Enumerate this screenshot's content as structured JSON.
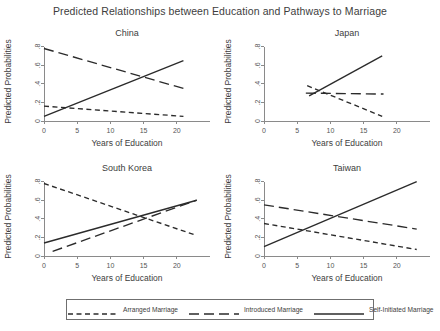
{
  "chart_data": {
    "type": "line",
    "title": "Predicted Relationships between Education and Pathways to Marriage",
    "xlabel": "Years of Education",
    "ylabel": "Predicted Probabilities",
    "xlim": [
      0,
      25
    ],
    "ylim": [
      0,
      0.85
    ],
    "xticks": [
      0,
      5,
      10,
      15,
      20
    ],
    "xtick_labels": [
      "0",
      "5",
      "10",
      "15",
      "20"
    ],
    "yticks": [
      0,
      0.2,
      0.4,
      0.6,
      0.8
    ],
    "ytick_labels": [
      "0",
      ".2",
      ".4",
      ".6",
      ".8"
    ],
    "grid": false,
    "legend_position": "bottom",
    "legend": [
      {
        "name": "Arranged Marriage",
        "dash": "short"
      },
      {
        "name": "Introduced Marriage",
        "dash": "long"
      },
      {
        "name": "Self-Initiated Marriage",
        "dash": "solid"
      }
    ],
    "panels": [
      {
        "title": "China",
        "series": [
          {
            "name": "Arranged Marriage",
            "dash": "short",
            "x": [
              0,
              21
            ],
            "y": [
              0.16,
              0.05
            ]
          },
          {
            "name": "Introduced Marriage",
            "dash": "long",
            "x": [
              0,
              21
            ],
            "y": [
              0.78,
              0.35
            ]
          },
          {
            "name": "Self-Initiated Marriage",
            "dash": "solid",
            "x": [
              0,
              21
            ],
            "y": [
              0.05,
              0.65
            ]
          }
        ]
      },
      {
        "title": "Japan",
        "series": [
          {
            "name": "Arranged Marriage",
            "dash": "short",
            "x": [
              6.5,
              17.8
            ],
            "y": [
              0.38,
              0.05
            ]
          },
          {
            "name": "Introduced Marriage",
            "dash": "long",
            "x": [
              6.3,
              18.0
            ],
            "y": [
              0.3,
              0.29
            ]
          },
          {
            "name": "Self-Initiated Marriage",
            "dash": "solid",
            "x": [
              6.8,
              17.8
            ],
            "y": [
              0.27,
              0.7
            ]
          }
        ]
      },
      {
        "title": "South Korea",
        "series": [
          {
            "name": "Arranged Marriage",
            "dash": "short",
            "x": [
              0,
              23
            ],
            "y": [
              0.78,
              0.22
            ]
          },
          {
            "name": "Introduced Marriage",
            "dash": "long",
            "x": [
              1.3,
              23
            ],
            "y": [
              0.05,
              0.6
            ]
          },
          {
            "name": "Self-Initiated Marriage",
            "dash": "solid",
            "x": [
              0,
              23
            ],
            "y": [
              0.14,
              0.6
            ]
          }
        ]
      },
      {
        "title": "Taiwan",
        "series": [
          {
            "name": "Arranged Marriage",
            "dash": "short",
            "x": [
              0,
              23
            ],
            "y": [
              0.35,
              0.07
            ]
          },
          {
            "name": "Introduced Marriage",
            "dash": "long",
            "x": [
              0,
              23
            ],
            "y": [
              0.55,
              0.29
            ]
          },
          {
            "name": "Self-Initiated Marriage",
            "dash": "solid",
            "x": [
              0,
              23
            ],
            "y": [
              0.1,
              0.8
            ]
          }
        ]
      }
    ]
  }
}
